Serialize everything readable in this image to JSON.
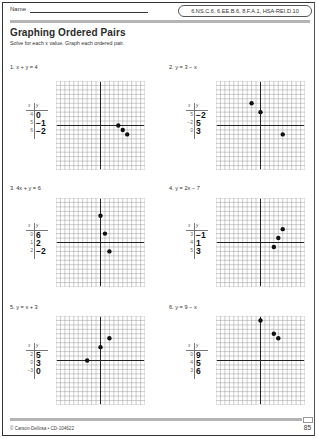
{
  "header": {
    "name_label": "Name",
    "standards": "6.NS.C.6, 6.EE.B.6, 8.F.A.1, HSA-REI.D.10"
  },
  "title": "Graphing Ordered Pairs",
  "instructions": "Solve for each x value. Graph each ordered pair.",
  "table_headers": {
    "x": "x",
    "y": "y"
  },
  "problems": [
    {
      "label": "1. x + y = 4",
      "rows": [
        {
          "x": "4",
          "y": "0"
        },
        {
          "x": "5",
          "y": "−1"
        },
        {
          "x": "6",
          "y": "−2"
        }
      ],
      "points": [
        [
          4,
          0
        ],
        [
          5,
          -1
        ],
        [
          6,
          -2
        ]
      ]
    },
    {
      "label": "2. y = 3 − x",
      "rows": [
        {
          "x": "5",
          "y": "−2"
        },
        {
          "x": "−2",
          "y": "5"
        },
        {
          "x": "0",
          "y": "3"
        }
      ],
      "points": [
        [
          5,
          -2
        ],
        [
          -2,
          5
        ],
        [
          0,
          3
        ]
      ]
    },
    {
      "label": "3. 4x + y = 6",
      "rows": [
        {
          "x": "0",
          "y": "6"
        },
        {
          "x": "1",
          "y": "2"
        },
        {
          "x": "2",
          "y": "−2"
        }
      ],
      "points": [
        [
          0,
          6
        ],
        [
          1,
          2
        ],
        [
          2,
          -2
        ]
      ]
    },
    {
      "label": "4. y = 2x − 7",
      "rows": [
        {
          "x": "3",
          "y": "−1"
        },
        {
          "x": "4",
          "y": "1"
        },
        {
          "x": "5",
          "y": "3"
        }
      ],
      "points": [
        [
          3,
          -1
        ],
        [
          4,
          1
        ],
        [
          5,
          3
        ]
      ]
    },
    {
      "label": "5. y = x + 3",
      "rows": [
        {
          "x": "2",
          "y": "5"
        },
        {
          "x": "0",
          "y": "3"
        },
        {
          "x": "−3",
          "y": "0"
        }
      ],
      "points": [
        [
          2,
          5
        ],
        [
          0,
          3
        ],
        [
          -3,
          0
        ]
      ]
    },
    {
      "label": "6. y = 9 − x",
      "rows": [
        {
          "x": "0",
          "y": "9"
        },
        {
          "x": "4",
          "y": "5"
        },
        {
          "x": "3",
          "y": "6"
        }
      ],
      "points": [
        [
          0,
          9
        ],
        [
          4,
          5
        ],
        [
          3,
          6
        ]
      ]
    }
  ],
  "grid": {
    "cells": 20,
    "min": -10,
    "max": 10,
    "line_color": "#9a9a9a",
    "axis_color": "#222222",
    "point_color": "#111111"
  },
  "footer": {
    "copyright": "© Carson-Dellosa • CD-104622",
    "page_number": "85"
  }
}
